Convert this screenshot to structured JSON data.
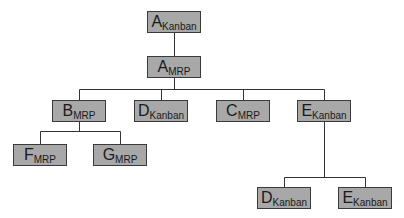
{
  "diagram": {
    "type": "tree",
    "colors": {
      "node_fill": "#a8a8a8",
      "node_border": "#3a3a3a",
      "line": "#333333"
    },
    "nodes": [
      {
        "id": "a_kanban",
        "letter": "A",
        "sub": "Kanban",
        "x": 147,
        "y": 11
      },
      {
        "id": "a_mrp",
        "letter": "A",
        "sub": "MRP",
        "x": 147,
        "y": 56
      },
      {
        "id": "b_mrp",
        "letter": "B",
        "sub": "MRP",
        "x": 52,
        "y": 100
      },
      {
        "id": "d_kanban_1",
        "letter": "D",
        "sub": "Kanban",
        "x": 134,
        "y": 100
      },
      {
        "id": "c_mrp",
        "letter": "C",
        "sub": "MRP",
        "x": 216,
        "y": 100
      },
      {
        "id": "e_kanban_1",
        "letter": "E",
        "sub": "Kanban",
        "x": 297,
        "y": 100
      },
      {
        "id": "f_mrp",
        "letter": "F",
        "sub": "MRP",
        "x": 13,
        "y": 144
      },
      {
        "id": "g_mrp",
        "letter": "G",
        "sub": "MRP",
        "x": 93,
        "y": 144
      },
      {
        "id": "d_kanban_2",
        "letter": "D",
        "sub": "Kanban",
        "x": 257,
        "y": 187
      },
      {
        "id": "e_kanban_2",
        "letter": "E",
        "sub": "Kanban",
        "x": 338,
        "y": 187
      }
    ],
    "edges": [
      [
        "a_kanban",
        "a_mrp"
      ],
      [
        "a_mrp",
        "b_mrp"
      ],
      [
        "a_mrp",
        "d_kanban_1"
      ],
      [
        "a_mrp",
        "c_mrp"
      ],
      [
        "a_mrp",
        "e_kanban_1"
      ],
      [
        "b_mrp",
        "f_mrp"
      ],
      [
        "b_mrp",
        "g_mrp"
      ],
      [
        "e_kanban_1",
        "d_kanban_2"
      ],
      [
        "e_kanban_1",
        "e_kanban_2"
      ]
    ]
  }
}
